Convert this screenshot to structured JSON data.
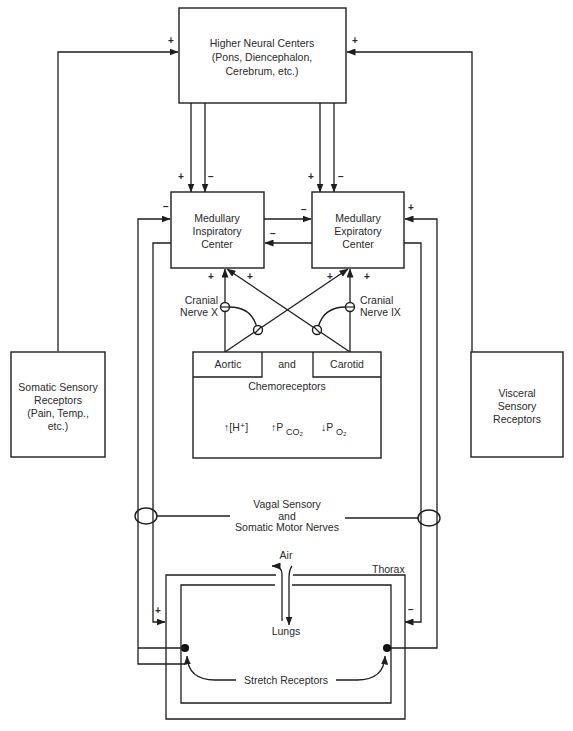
{
  "diagram": {
    "colors": {
      "line": "#1e1e1e",
      "text": "#2a2a2a",
      "background": "#ffffff"
    },
    "higher_centers": {
      "line1": "Higher Neural Centers",
      "line2": "(Pons, Diencephalon,",
      "line3": "Cerebrum, etc.)"
    },
    "inspiratory_center": {
      "line1": "Medullary",
      "line2": "Inspiratory",
      "line3": "Center"
    },
    "expiratory_center": {
      "line1": "Medullary",
      "line2": "Expiratory",
      "line3": "Center"
    },
    "somatic_receptors": {
      "line1": "Somatic Sensory",
      "line2": "Receptors",
      "line3": "(Pain, Temp.,",
      "line4": "etc.)"
    },
    "visceral_receptors": {
      "line1": "Visceral",
      "line2": "Sensory",
      "line3": "Receptors"
    },
    "cranial_nerve_x": {
      "line1": "Cranial",
      "line2": "Nerve X"
    },
    "cranial_nerve_ix": {
      "line1": "Cranial",
      "line2": "Nerve IX"
    },
    "chemoreceptors": {
      "aortic": "Aortic",
      "and": "and",
      "carotid": "Carotid",
      "label": "Chemoreceptors",
      "stimulus1": "↑[H⁺]",
      "stimulus2_main": "↑P",
      "stimulus2_sub": "CO₂",
      "stimulus3_main": "↓P",
      "stimulus3_sub": "O₂"
    },
    "nerves": {
      "line1": "Vagal Sensory",
      "line2": "and",
      "line3": "Somatic Motor Nerves"
    },
    "air_label": "Air",
    "thorax_label": "Thorax",
    "lungs_label": "Lungs",
    "stretch_label": "Stretch Receptors",
    "signs": {
      "somatic_to_higher": "+",
      "visceral_to_higher": "+",
      "higher_to_insp_excite": "+",
      "higher_to_insp_inhibit": "−",
      "higher_to_exp_excite": "+",
      "higher_to_exp_inhibit": "−",
      "stretch_to_insp": "−",
      "insp_to_exp": "−",
      "exp_to_insp": "−",
      "stretch_to_exp": "+",
      "cnx_to_insp": "+",
      "cnix_to_insp": "+",
      "cnx_to_exp": "+",
      "cnix_to_exp": "+",
      "insp_to_thorax": "+",
      "exp_to_thorax": "−"
    }
  }
}
